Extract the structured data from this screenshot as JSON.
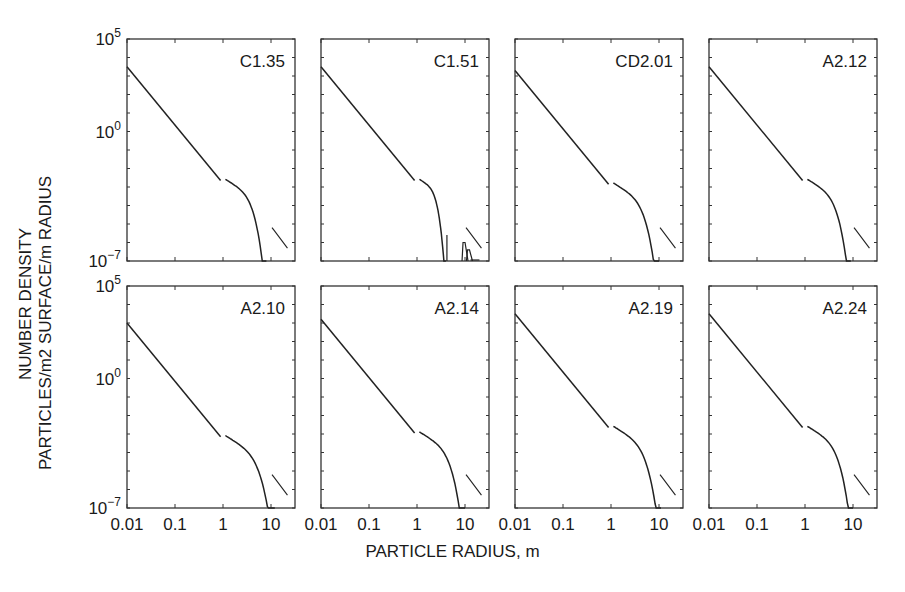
{
  "figure": {
    "ylabel_line1": "NUMBER DENSITY",
    "ylabel_line2": "PARTICLES/m2 SURFACE/m RADIUS",
    "xlabel": "PARTICLE RADIUS, m"
  },
  "chart_data": {
    "type": "line",
    "layout": "2x4 small multiples",
    "xlabel": "PARTICLE RADIUS, m",
    "ylabel": "NUMBER DENSITY PARTICLES/m2 SURFACE/m RADIUS",
    "xscale": "log",
    "yscale": "log",
    "xlim": [
      0.01,
      31.6
    ],
    "ylim": [
      1e-07,
      100000.0
    ],
    "x_tick_labels": [
      "0.01",
      "0.1",
      "1",
      "10"
    ],
    "y_tick_labels": [
      "10^5",
      "10^0",
      "10^-7"
    ],
    "grid": false,
    "panels": [
      {
        "label": "C1.35",
        "row": 0,
        "col": 0,
        "start_log_y": 3.5,
        "knee_x": 1.0,
        "cutoff_x": 8.0,
        "reference_line": true
      },
      {
        "label": "C1.51",
        "row": 0,
        "col": 1,
        "start_log_y": 3.5,
        "knee_x": 1.0,
        "cutoff_x": 4.0,
        "secondary_peaks": [
          10.5,
          13
        ],
        "reference_line": true
      },
      {
        "label": "CD2.01",
        "row": 0,
        "col": 2,
        "start_log_y": 3.3,
        "knee_x": 1.0,
        "cutoff_x": 10.0,
        "reference_line": true
      },
      {
        "label": "A2.12",
        "row": 0,
        "col": 3,
        "start_log_y": 3.5,
        "knee_x": 1.0,
        "cutoff_x": 9.0,
        "reference_line": true
      },
      {
        "label": "A2.10",
        "row": 1,
        "col": 0,
        "start_log_y": 3.0,
        "knee_x": 1.0,
        "cutoff_x": 12.0,
        "reference_line": true
      },
      {
        "label": "A2.14",
        "row": 1,
        "col": 1,
        "start_log_y": 3.2,
        "knee_x": 1.0,
        "cutoff_x": 10.0,
        "reference_line": true
      },
      {
        "label": "A2.19",
        "row": 1,
        "col": 2,
        "start_log_y": 3.5,
        "knee_x": 1.0,
        "cutoff_x": 11.0,
        "reference_line": true
      },
      {
        "label": "A2.24",
        "row": 1,
        "col": 3,
        "start_log_y": 3.5,
        "knee_x": 1.0,
        "cutoff_x": 10.0,
        "reference_line": true
      }
    ],
    "power_law_slope": -3
  }
}
